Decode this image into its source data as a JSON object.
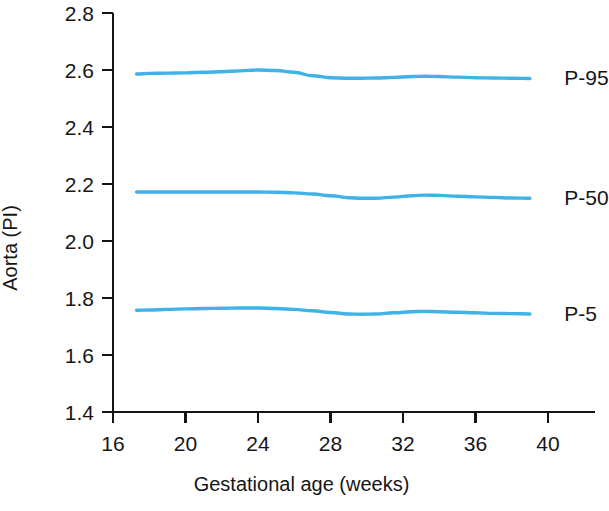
{
  "chart_data": {
    "type": "line",
    "title": "",
    "subtitle": "",
    "xlabel": "Gestational age (weeks)",
    "ylabel": "Aorta (PI)",
    "xlim": [
      16,
      40
    ],
    "ylim": [
      1.4,
      2.8
    ],
    "xticks": [
      16,
      20,
      24,
      28,
      32,
      36,
      40
    ],
    "yticks": [
      1.4,
      1.6,
      1.8,
      2.0,
      2.2,
      2.4,
      2.6,
      2.8
    ],
    "xtick_labels": [
      "16",
      "20",
      "24",
      "28",
      "32",
      "36",
      "40"
    ],
    "ytick_labels": [
      "1.4",
      "1.6",
      "1.8",
      "2.0",
      "2.2",
      "2.4",
      "2.6",
      "2.8"
    ],
    "grid": false,
    "legend_position": "right-inline",
    "line_color": "#3fb2e8",
    "line_width": 3.4,
    "axis_color": "#141414",
    "x": [
      17.3,
      18,
      19,
      20,
      21,
      22,
      23,
      24,
      25,
      26,
      27,
      28,
      29,
      29.7,
      30.5,
      31.5,
      32.5,
      33.2,
      34,
      35,
      36,
      37,
      38,
      39
    ],
    "series": [
      {
        "name": "P-95",
        "label": "P-95",
        "label_x": 40.9,
        "label_y": 2.575,
        "values": [
          2.586,
          2.588,
          2.589,
          2.59,
          2.592,
          2.594,
          2.597,
          2.6,
          2.598,
          2.592,
          2.58,
          2.573,
          2.571,
          2.571,
          2.572,
          2.574,
          2.577,
          2.578,
          2.577,
          2.575,
          2.573,
          2.572,
          2.571,
          2.57
        ]
      },
      {
        "name": "P-50",
        "label": "P-50",
        "label_x": 40.9,
        "label_y": 2.155,
        "values": [
          2.172,
          2.172,
          2.172,
          2.172,
          2.172,
          2.172,
          2.172,
          2.172,
          2.171,
          2.169,
          2.165,
          2.159,
          2.152,
          2.15,
          2.15,
          2.154,
          2.159,
          2.161,
          2.16,
          2.157,
          2.155,
          2.153,
          2.151,
          2.15
        ]
      },
      {
        "name": "P-5",
        "label": "P-5",
        "label_x": 40.9,
        "label_y": 1.748,
        "values": [
          1.757,
          1.758,
          1.76,
          1.762,
          1.763,
          1.764,
          1.765,
          1.765,
          1.763,
          1.76,
          1.755,
          1.749,
          1.744,
          1.743,
          1.744,
          1.748,
          1.752,
          1.753,
          1.752,
          1.75,
          1.748,
          1.746,
          1.745,
          1.744
        ]
      }
    ]
  }
}
